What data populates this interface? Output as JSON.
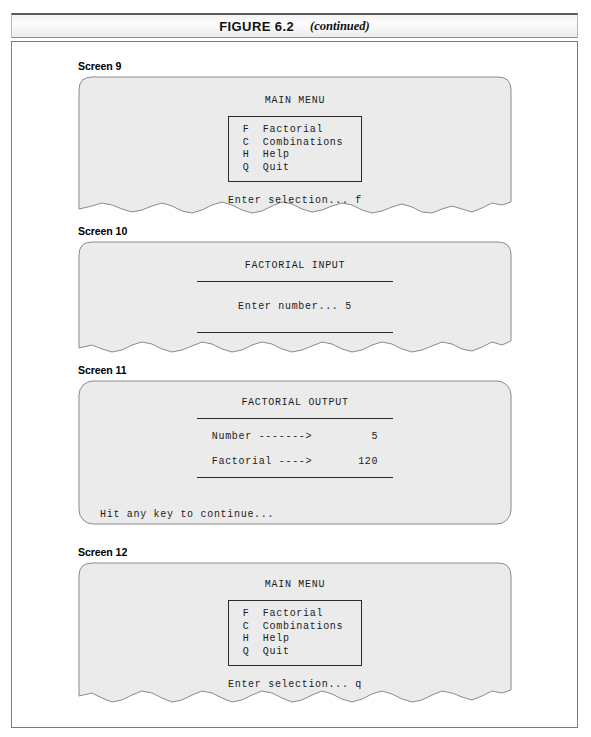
{
  "figure": {
    "label": "FIGURE 6.2",
    "continued": "(continued)"
  },
  "screens": [
    {
      "label": "Screen 9",
      "title": "MAIN MENU",
      "menu": [
        {
          "key": "F",
          "name": "Factorial"
        },
        {
          "key": "C",
          "name": "Combinations"
        },
        {
          "key": "H",
          "name": "Help"
        },
        {
          "key": "Q",
          "name": "Quit"
        }
      ],
      "prompt": "Enter selection... f",
      "edge": "torn"
    },
    {
      "label": "Screen 10",
      "title": "FACTORIAL INPUT",
      "prompt": "Enter number... 5",
      "edge": "torn"
    },
    {
      "label": "Screen 11",
      "title": "FACTORIAL OUTPUT",
      "rows": [
        {
          "label": "Number ------->",
          "value": "5"
        },
        {
          "label": "Factorial ---->",
          "value": "120"
        }
      ],
      "footer": "Hit any key to continue...",
      "edge": "rounded"
    },
    {
      "label": "Screen 12",
      "title": "MAIN MENU",
      "menu": [
        {
          "key": "F",
          "name": "Factorial"
        },
        {
          "key": "C",
          "name": "Combinations"
        },
        {
          "key": "H",
          "name": "Help"
        },
        {
          "key": "Q",
          "name": "Quit"
        }
      ],
      "prompt": "Enter selection... q",
      "edge": "torn"
    }
  ],
  "colors": {
    "screen_fill": "#ebebeb",
    "screen_stroke": "#8a8a8a",
    "text": "#1b1b1b",
    "frame": "#7b7b7b"
  }
}
